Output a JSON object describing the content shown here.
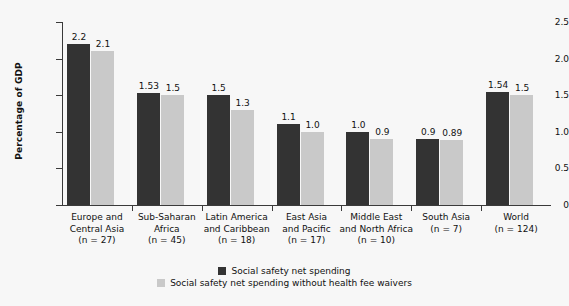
{
  "chart_data": {
    "type": "bar",
    "title": "",
    "xlabel": "",
    "ylabel": "Percentage of GDP",
    "ylim": [
      0,
      2.5
    ],
    "yticks": [
      "0",
      "0.5",
      "1.0",
      "1.5",
      "2.0",
      "2.5"
    ],
    "ytick_values": [
      0,
      0.5,
      1.0,
      1.5,
      2.0,
      2.5
    ],
    "grid": false,
    "legend_position": "bottom-center",
    "categories": [
      "Europe and Central Asia",
      "Sub-Saharan Africa",
      "Latin America and Caribbean",
      "East Asia and Pacific",
      "Middle East and North Africa",
      "South Asia",
      "World"
    ],
    "category_lines": [
      [
        "Europe and",
        "Central Asia",
        "(n = 27)"
      ],
      [
        "Sub-Saharan",
        "Africa",
        "(n = 45)"
      ],
      [
        "Latin America",
        "and Caribbean",
        "(n = 18)"
      ],
      [
        "East Asia",
        "and Pacific",
        "(n = 17)"
      ],
      [
        "Middle East",
        "and North Africa",
        "(n = 10)"
      ],
      [
        "South Asia",
        "",
        "(n = 7)"
      ],
      [
        "World",
        "",
        "(n = 124)"
      ]
    ],
    "series": [
      {
        "name": "Social safety net spending",
        "color": "#333333",
        "values": [
          2.2,
          1.53,
          1.5,
          1.1,
          1.0,
          0.9,
          1.54
        ],
        "labels": [
          "2.2",
          "1.53",
          "1.5",
          "1.1",
          "1.0",
          "0.9",
          "1.54"
        ]
      },
      {
        "name": "Social safety net spending without health fee waivers",
        "color": "#c9c9c9",
        "values": [
          2.1,
          1.5,
          1.3,
          1.0,
          0.9,
          0.89,
          1.5
        ],
        "labels": [
          "2.1",
          "1.5",
          "1.3",
          "1.0",
          "0.9",
          "0.89",
          "1.5"
        ]
      }
    ]
  },
  "legend": [
    {
      "label": "Social safety net spending",
      "color": "#333333"
    },
    {
      "label": "Social safety net spending without health fee waivers",
      "color": "#c9c9c9"
    }
  ],
  "axis": {
    "y_title": "Percentage of GDP"
  }
}
